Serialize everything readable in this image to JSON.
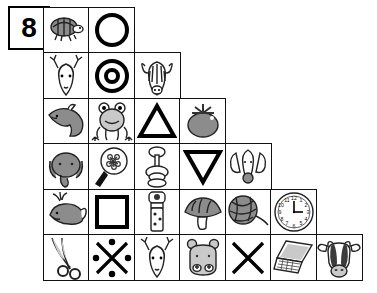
{
  "exercise": {
    "number_label": "8",
    "type": "picture-staircase-grid",
    "rows": 6,
    "columns_per_row": [
      2,
      3,
      4,
      5,
      6,
      7
    ],
    "cell_size_px": 47
  },
  "grid": {
    "rows": [
      {
        "row_index": 1,
        "cells": [
          {
            "icon": "turtle-icon",
            "label": "turtle"
          },
          {
            "icon": "circle-icon",
            "label": "circle"
          }
        ]
      },
      {
        "row_index": 2,
        "cells": [
          {
            "icon": "deer-head-icon",
            "label": "deer"
          },
          {
            "icon": "ring-circle-icon",
            "label": "concentric circles"
          },
          {
            "icon": "zebra-head-icon",
            "label": "zebra"
          }
        ]
      },
      {
        "row_index": 3,
        "cells": [
          {
            "icon": "dolphin-icon",
            "label": "dolphin"
          },
          {
            "icon": "frog-icon",
            "label": "frog"
          },
          {
            "icon": "triangle-up-icon",
            "label": "triangle"
          },
          {
            "icon": "tomato-icon",
            "label": "tomato"
          }
        ]
      },
      {
        "row_index": 4,
        "cells": [
          {
            "icon": "elephant-head-icon",
            "label": "elephant"
          },
          {
            "icon": "magnifier-flower-icon",
            "label": "magnifying glass"
          },
          {
            "icon": "spinning-top-icon",
            "label": "spinning top"
          },
          {
            "icon": "triangle-down-icon",
            "label": "inverted triangle"
          },
          {
            "icon": "dog-head-icon",
            "label": "dog"
          }
        ]
      },
      {
        "row_index": 5,
        "cells": [
          {
            "icon": "whale-icon",
            "label": "whale"
          },
          {
            "icon": "square-icon",
            "label": "square"
          },
          {
            "icon": "flashlight-icon",
            "label": "flashlight"
          },
          {
            "icon": "mushroom-icon",
            "label": "mushroom"
          },
          {
            "icon": "yarn-ball-icon",
            "label": "ball of yarn"
          },
          {
            "icon": "clock-icon",
            "label": "clock",
            "time": "3:00"
          }
        ]
      },
      {
        "row_index": 6,
        "cells": [
          {
            "icon": "scissors-icon",
            "label": "scissors"
          },
          {
            "icon": "x-dots-icon",
            "label": "cross with dots"
          },
          {
            "icon": "deer-head-icon",
            "label": "deer"
          },
          {
            "icon": "hippo-head-icon",
            "label": "hippo"
          },
          {
            "icon": "x-cross-icon",
            "label": "X cross"
          },
          {
            "icon": "laptop-icon",
            "label": "laptop"
          },
          {
            "icon": "cow-head-icon",
            "label": "cow"
          }
        ]
      }
    ]
  },
  "colors": {
    "ink": "#000000",
    "line": "#222222",
    "fill_dark": "#3b3b3b",
    "fill_mid": "#8c8c8c",
    "fill_light": "#c9c9c9",
    "background": "#ffffff"
  }
}
